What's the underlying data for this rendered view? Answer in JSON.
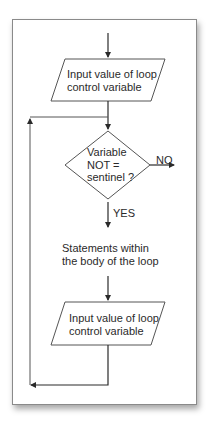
{
  "diagram": {
    "type": "flowchart",
    "nodes": [
      {
        "id": "input1",
        "shape": "parallelogram",
        "line1": "Input value of loop",
        "line2": "control variable"
      },
      {
        "id": "decision",
        "shape": "diamond",
        "line1": "Variable",
        "line2": "NOT =",
        "line3": "sentinel ?"
      },
      {
        "id": "body",
        "shape": "text",
        "line1": "Statements within",
        "line2": "the body of the loop"
      },
      {
        "id": "input2",
        "shape": "parallelogram",
        "line1": "Input value of loop",
        "line2": "control variable"
      }
    ],
    "edges": [
      {
        "from": "start",
        "to": "input1",
        "label": ""
      },
      {
        "from": "input1",
        "to": "decision",
        "label": ""
      },
      {
        "from": "decision",
        "to": "exit",
        "label": "NO"
      },
      {
        "from": "decision",
        "to": "body",
        "label": "YES"
      },
      {
        "from": "body",
        "to": "input2",
        "label": ""
      },
      {
        "from": "input2",
        "to": "decision",
        "label": ""
      }
    ],
    "labels": {
      "no": "NO",
      "yes": "YES"
    },
    "colors": {
      "stroke": "#2a2a2a",
      "frame": "#8a8a8a",
      "background": "#ffffff"
    }
  }
}
